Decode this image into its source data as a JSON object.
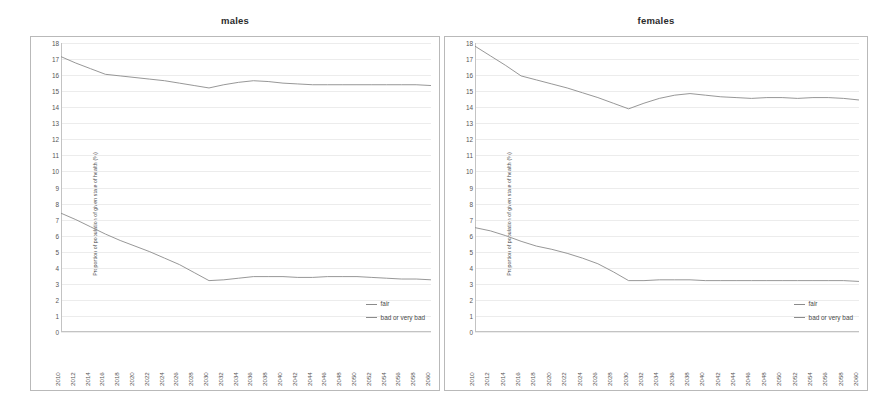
{
  "panels": [
    {
      "title": "males",
      "key": "males"
    },
    {
      "title": "females",
      "key": "females"
    }
  ],
  "axis": {
    "ylabel": "Proportion of population of given state of health (%)",
    "yticks": [
      "0",
      "1",
      "2",
      "3",
      "4",
      "5",
      "6",
      "7",
      "8",
      "9",
      "10",
      "11",
      "12",
      "13",
      "14",
      "15",
      "16",
      "17",
      "18"
    ],
    "xlabel": ""
  },
  "legend": {
    "position": "bottom-right",
    "entries": [
      {
        "label": "fair",
        "color": "#8b8b8b"
      },
      {
        "label": "bad or very bad",
        "color": "#8b8b8b"
      }
    ]
  },
  "colors": {
    "line": "#8b8b8b",
    "grid": "#ececec",
    "axis": "#c3c3c3",
    "border": "#b9b9b9",
    "text": "#565656",
    "background": "#ffffff"
  },
  "chart_data": [
    {
      "type": "line",
      "title": "males",
      "xlabel": "",
      "ylabel": "Proportion of population of given state of health (%)",
      "ylim": [
        0,
        18
      ],
      "xlim": [
        2010,
        2060
      ],
      "grid": true,
      "legend_position": "bottom-right",
      "x": [
        2010,
        2012,
        2014,
        2016,
        2018,
        2020,
        2022,
        2024,
        2026,
        2028,
        2030,
        2032,
        2034,
        2036,
        2038,
        2040,
        2042,
        2044,
        2046,
        2048,
        2050,
        2052,
        2054,
        2056,
        2058,
        2060
      ],
      "xticklabels": [
        "2010",
        "2012",
        "2014",
        "2016",
        "2018",
        "2020",
        "2022",
        "2024",
        "2026",
        "2028",
        "2030",
        "2032",
        "2034",
        "2036",
        "2038",
        "2040",
        "2042",
        "2044",
        "2046",
        "2048",
        "2050",
        "2052",
        "2054",
        "2056",
        "2058",
        "2060"
      ],
      "series": [
        {
          "name": "fair",
          "values": [
            17.15,
            16.75,
            16.4,
            16.05,
            15.95,
            15.85,
            15.75,
            15.65,
            15.5,
            15.35,
            15.2,
            15.4,
            15.55,
            15.65,
            15.6,
            15.5,
            15.45,
            15.4,
            15.4,
            15.4,
            15.4,
            15.4,
            15.4,
            15.4,
            15.4,
            15.35
          ]
        },
        {
          "name": "bad or very bad",
          "values": [
            7.4,
            7.0,
            6.55,
            6.1,
            5.7,
            5.35,
            5.0,
            4.6,
            4.2,
            3.7,
            3.2,
            3.25,
            3.35,
            3.45,
            3.45,
            3.45,
            3.4,
            3.4,
            3.45,
            3.45,
            3.45,
            3.4,
            3.35,
            3.3,
            3.3,
            3.25
          ]
        }
      ]
    },
    {
      "type": "line",
      "title": "females",
      "xlabel": "",
      "ylabel": "Proportion of population of given state of health (%)",
      "ylim": [
        0,
        18
      ],
      "xlim": [
        2010,
        2060
      ],
      "grid": true,
      "legend_position": "bottom-right",
      "x": [
        2010,
        2012,
        2014,
        2016,
        2018,
        2020,
        2022,
        2024,
        2026,
        2028,
        2030,
        2032,
        2034,
        2036,
        2038,
        2040,
        2042,
        2044,
        2046,
        2048,
        2050,
        2052,
        2054,
        2056,
        2058,
        2060
      ],
      "xticklabels": [
        "2010",
        "2012",
        "2014",
        "2016",
        "2018",
        "2020",
        "2022",
        "2024",
        "2026",
        "2028",
        "2030",
        "2032",
        "2034",
        "2036",
        "2038",
        "2040",
        "2042",
        "2044",
        "2046",
        "2048",
        "2050",
        "2052",
        "2054",
        "2056",
        "2058",
        "2060"
      ],
      "series": [
        {
          "name": "fair",
          "values": [
            17.8,
            17.2,
            16.6,
            15.95,
            15.7,
            15.45,
            15.2,
            14.9,
            14.6,
            14.25,
            13.9,
            14.25,
            14.55,
            14.75,
            14.85,
            14.75,
            14.65,
            14.6,
            14.55,
            14.6,
            14.6,
            14.55,
            14.6,
            14.6,
            14.55,
            14.45
          ]
        },
        {
          "name": "bad or very bad",
          "values": [
            6.5,
            6.3,
            6.0,
            5.65,
            5.35,
            5.15,
            4.9,
            4.6,
            4.25,
            3.75,
            3.2,
            3.2,
            3.25,
            3.25,
            3.25,
            3.2,
            3.2,
            3.2,
            3.2,
            3.2,
            3.2,
            3.2,
            3.2,
            3.2,
            3.2,
            3.15
          ]
        }
      ]
    }
  ]
}
